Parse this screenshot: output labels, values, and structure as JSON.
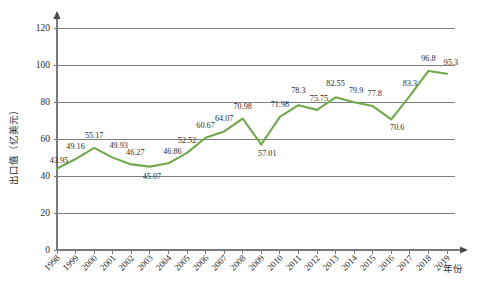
{
  "chart_data": {
    "type": "line",
    "title": "",
    "xlabel": "年份",
    "ylabel": "出口值（亿美元）",
    "categories": [
      "1998",
      "1999",
      "2000",
      "2001",
      "2002",
      "2003",
      "2004",
      "2005",
      "2006",
      "2007",
      "2008",
      "2009",
      "2010",
      "2011",
      "2012",
      "2013",
      "2014",
      "2015",
      "2016",
      "2017",
      "2018",
      "2019"
    ],
    "values": [
      43.95,
      49.16,
      55.17,
      49.93,
      46.27,
      45.07,
      46.86,
      52.52,
      60.67,
      64.07,
      70.98,
      57.01,
      71.98,
      78.3,
      75.75,
      82.55,
      79.9,
      77.8,
      70.6,
      83.3,
      96.8,
      95.3
    ],
    "point_labels": [
      "43.95",
      "49.16",
      "55.17",
      "49.93",
      "46.27",
      "45.07",
      "46.86",
      "52.52",
      "60.67",
      "64.07",
      "70.98",
      "57.01",
      "71.98",
      "78.3",
      "75.75",
      "82.55",
      "79.9",
      "77.8",
      "70.6",
      "83.3",
      "96.8",
      "95.3"
    ],
    "ylim": [
      0,
      120
    ],
    "yticks": [
      0,
      20,
      40,
      60,
      80,
      100,
      120
    ],
    "ytick_labels": [
      "0",
      "20",
      "40",
      "60",
      "80",
      "100",
      "120"
    ],
    "grid": true,
    "grid_axis": "y",
    "legend": "none",
    "series_color": "#6FA94A",
    "grid_color": "#808080",
    "axis_color": "#7a7a7a"
  }
}
